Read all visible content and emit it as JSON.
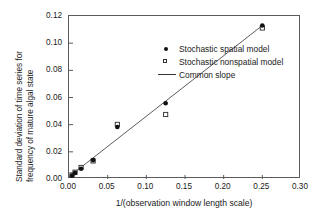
{
  "chart_data": {
    "type": "scatter",
    "title": "",
    "xlabel": "1/(observation window length scale)",
    "ylabel_line1": "Standard deviation of time series for",
    "ylabel_line2": "frequency of mature algal state",
    "xlim": [
      0.0,
      0.3
    ],
    "ylim": [
      0.0,
      0.12
    ],
    "xticks": [
      "0.00",
      "0.05",
      "0.10",
      "0.15",
      "0.20",
      "0.25",
      "0.30"
    ],
    "xtick_values": [
      0.0,
      0.05,
      0.1,
      0.15,
      0.2,
      0.25,
      0.3
    ],
    "yticks": [
      "0.00",
      "0.02",
      "0.04",
      "0.06",
      "0.08",
      "0.10",
      "0.12"
    ],
    "ytick_values": [
      0.0,
      0.02,
      0.04,
      0.06,
      0.08,
      0.1,
      0.12
    ],
    "grid": false,
    "legend_position": "upper-left-inside",
    "series": [
      {
        "name": "Stochastic spatial model",
        "marker": "filled-circle",
        "x": [
          0.0039,
          0.0078,
          0.0156,
          0.0312,
          0.0625,
          0.125,
          0.25
        ],
        "values": [
          0.0025,
          0.0045,
          0.0075,
          0.0139,
          0.0383,
          0.0558,
          0.113
        ]
      },
      {
        "name": "Stochastic nonspatial model",
        "marker": "open-square",
        "x": [
          0.0039,
          0.0078,
          0.0156,
          0.0312,
          0.0625,
          0.125,
          0.25
        ],
        "values": [
          0.003,
          0.005,
          0.0085,
          0.0133,
          0.0402,
          0.0475,
          0.1112
        ]
      },
      {
        "name": "Common slope",
        "marker": "line",
        "line_endpoints": [
          [
            0.0,
            0.0017
          ],
          [
            0.25,
            0.113
          ]
        ]
      }
    ]
  },
  "legend": {
    "items": [
      {
        "label": "Stochastic spatial model",
        "key": "filled-circle-marker"
      },
      {
        "label": "Stochastic nonspatial model",
        "key": "open-square-marker"
      },
      {
        "label": "Common slope",
        "key": "line-sample"
      }
    ]
  }
}
